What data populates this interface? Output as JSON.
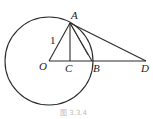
{
  "diagram": {
    "type": "geometry",
    "circle": {
      "center": "O",
      "radius_label": "1"
    },
    "points": {
      "A": {
        "label": "A"
      },
      "O": {
        "label": "O"
      },
      "C": {
        "label": "C"
      },
      "B": {
        "label": "B"
      },
      "D": {
        "label": "D"
      }
    },
    "segments": [
      "OA",
      "AC",
      "AB",
      "AD",
      "OD"
    ],
    "radius_label": "1",
    "caption": "图 3.3.4"
  }
}
